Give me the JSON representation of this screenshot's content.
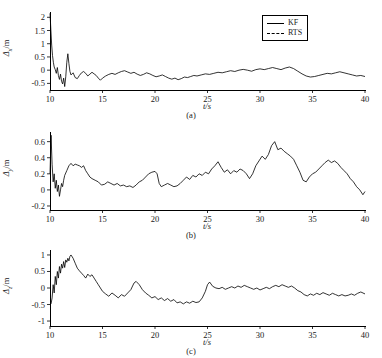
{
  "figure": {
    "legend": {
      "entries": [
        {
          "label": "KF",
          "style": "solid",
          "color": "#000000"
        },
        {
          "label": "RTS",
          "style": "dashed",
          "color": "#000000"
        }
      ]
    }
  },
  "chart_data": [
    {
      "type": "line",
      "panel": "a",
      "caption": "(a)",
      "title": "",
      "xlabel": "t/s",
      "ylabel": "Δx/m",
      "ylabel_symbol": "Δ",
      "ylabel_sub": "x",
      "ylabel_unit": "/m",
      "xlim": [
        10,
        40
      ],
      "ylim": [
        -0.75,
        2.2
      ],
      "xticks": [
        10,
        15,
        20,
        25,
        30,
        35,
        40
      ],
      "yticks": [
        -0.5,
        0,
        0.5,
        1,
        1.5,
        2
      ],
      "ytick_labels": [
        "-0.5",
        "0",
        "0.5",
        "1",
        "1.5",
        "2"
      ],
      "grid": false,
      "legend_position": "top-right",
      "series": [
        {
          "name": "KF",
          "x": [
            10.0,
            10.08,
            10.16,
            10.24,
            10.32,
            10.4,
            10.5,
            10.6,
            10.7,
            10.8,
            10.9,
            11.0,
            11.1,
            11.2,
            11.3,
            11.4,
            11.5,
            11.6,
            11.7,
            11.8,
            11.9,
            12.0,
            12.2,
            12.4,
            12.6,
            12.8,
            13.0,
            13.2,
            13.4,
            13.6,
            13.8,
            14.0,
            14.2,
            14.4,
            14.6,
            14.8,
            15.0,
            15.3,
            15.6,
            15.9,
            16.2,
            16.5,
            16.8,
            17.1,
            17.4,
            17.7,
            18.0,
            18.3,
            18.6,
            18.9,
            19.2,
            19.5,
            19.8,
            20.1,
            20.4,
            20.7,
            21.0,
            21.3,
            21.6,
            21.9,
            22.2,
            22.5,
            22.8,
            23.1,
            23.4,
            23.7,
            24.0,
            24.4,
            24.8,
            25.2,
            25.6,
            26.0,
            26.4,
            26.8,
            27.2,
            27.6,
            28.0,
            28.4,
            28.8,
            29.2,
            29.6,
            30.0,
            30.4,
            30.8,
            31.2,
            31.6,
            32.0,
            32.4,
            32.8,
            33.2,
            33.6,
            34.0,
            34.4,
            34.8,
            35.2,
            35.6,
            36.0,
            36.4,
            36.8,
            37.2,
            37.6,
            38.0,
            38.4,
            38.8,
            39.2,
            39.6,
            40.0
          ],
          "values": [
            2.15,
            1.55,
            0.95,
            0.55,
            0.3,
            0.12,
            0.02,
            -0.12,
            0.1,
            -0.2,
            -0.35,
            -0.15,
            -0.42,
            -0.52,
            -0.3,
            -0.62,
            -0.25,
            0.3,
            0.62,
            0.25,
            -0.05,
            -0.18,
            -0.1,
            -0.28,
            -0.32,
            -0.2,
            -0.1,
            -0.05,
            -0.12,
            -0.22,
            -0.15,
            -0.08,
            -0.14,
            -0.2,
            -0.3,
            -0.38,
            -0.3,
            -0.22,
            -0.16,
            -0.12,
            -0.16,
            -0.1,
            -0.05,
            -0.02,
            -0.07,
            -0.12,
            -0.08,
            -0.15,
            -0.2,
            -0.16,
            -0.1,
            -0.14,
            -0.2,
            -0.25,
            -0.22,
            -0.18,
            -0.24,
            -0.3,
            -0.34,
            -0.3,
            -0.36,
            -0.32,
            -0.26,
            -0.28,
            -0.24,
            -0.2,
            -0.22,
            -0.18,
            -0.14,
            -0.16,
            -0.12,
            -0.08,
            -0.1,
            -0.06,
            -0.02,
            -0.05,
            0.0,
            0.03,
            0.0,
            -0.04,
            0.02,
            0.05,
            0.02,
            0.06,
            0.1,
            0.06,
            0.02,
            0.08,
            0.12,
            0.06,
            -0.04,
            -0.14,
            -0.22,
            -0.26,
            -0.24,
            -0.2,
            -0.16,
            -0.12,
            -0.14,
            -0.1,
            -0.06,
            -0.1,
            -0.14,
            -0.18,
            -0.22,
            -0.2,
            -0.24
          ]
        }
      ]
    },
    {
      "type": "line",
      "panel": "b",
      "caption": "(b)",
      "title": "",
      "xlabel": "t/s",
      "ylabel": "Δy/m",
      "ylabel_symbol": "Δ",
      "ylabel_sub": "y",
      "ylabel_unit": "/m",
      "xlim": [
        10,
        40
      ],
      "ylim": [
        -0.25,
        0.72
      ],
      "xticks": [
        10,
        15,
        20,
        25,
        30,
        35,
        40
      ],
      "yticks": [
        -0.2,
        0,
        0.2,
        0.4,
        0.6
      ],
      "ytick_labels": [
        "-0.2",
        "0",
        "0.2",
        "0.4",
        "0.6"
      ],
      "grid": false,
      "legend_position": "none",
      "series": [
        {
          "name": "KF",
          "x": [
            10.0,
            10.1,
            10.2,
            10.3,
            10.4,
            10.5,
            10.6,
            10.7,
            10.8,
            10.9,
            11.0,
            11.1,
            11.2,
            11.3,
            11.4,
            11.6,
            11.8,
            12.0,
            12.2,
            12.4,
            12.6,
            12.8,
            13.0,
            13.2,
            13.4,
            13.6,
            13.8,
            14.0,
            14.3,
            14.6,
            14.9,
            15.2,
            15.5,
            15.8,
            16.1,
            16.4,
            16.7,
            17.0,
            17.3,
            17.6,
            17.9,
            18.2,
            18.5,
            18.8,
            19.1,
            19.4,
            19.7,
            20.0,
            20.2,
            20.4,
            20.6,
            20.9,
            21.2,
            21.5,
            21.8,
            22.1,
            22.4,
            22.7,
            23.0,
            23.3,
            23.6,
            23.9,
            24.2,
            24.5,
            24.8,
            25.1,
            25.4,
            25.7,
            26.0,
            26.3,
            26.6,
            26.9,
            27.2,
            27.5,
            27.8,
            28.1,
            28.4,
            28.7,
            29.0,
            29.3,
            29.6,
            29.9,
            30.2,
            30.5,
            30.8,
            31.1,
            31.4,
            31.7,
            32.0,
            32.3,
            32.6,
            32.9,
            33.2,
            33.5,
            33.8,
            34.1,
            34.4,
            34.7,
            35.0,
            35.3,
            35.6,
            35.9,
            36.2,
            36.5,
            36.8,
            37.1,
            37.4,
            37.7,
            38.0,
            38.3,
            38.6,
            38.9,
            39.2,
            39.5,
            39.8,
            40.0
          ],
          "values": [
            0.2,
            0.68,
            0.32,
            0.1,
            0.2,
            0.02,
            0.12,
            -0.02,
            0.06,
            -0.08,
            0.0,
            0.08,
            0.04,
            0.12,
            0.18,
            0.24,
            0.3,
            0.33,
            0.3,
            0.32,
            0.31,
            0.3,
            0.28,
            0.3,
            0.24,
            0.2,
            0.16,
            0.14,
            0.12,
            0.1,
            0.06,
            0.07,
            0.1,
            0.08,
            0.06,
            0.08,
            0.05,
            0.06,
            0.04,
            0.05,
            0.03,
            0.06,
            0.1,
            0.12,
            0.16,
            0.2,
            0.22,
            0.23,
            0.2,
            0.08,
            0.04,
            0.06,
            0.08,
            0.06,
            0.04,
            0.05,
            0.08,
            0.12,
            0.16,
            0.13,
            0.18,
            0.16,
            0.2,
            0.18,
            0.22,
            0.2,
            0.26,
            0.3,
            0.35,
            0.28,
            0.22,
            0.25,
            0.2,
            0.24,
            0.22,
            0.26,
            0.24,
            0.2,
            0.14,
            0.2,
            0.3,
            0.36,
            0.42,
            0.38,
            0.44,
            0.55,
            0.6,
            0.5,
            0.52,
            0.48,
            0.45,
            0.42,
            0.38,
            0.3,
            0.22,
            0.12,
            0.1,
            0.16,
            0.2,
            0.22,
            0.26,
            0.3,
            0.34,
            0.37,
            0.34,
            0.36,
            0.33,
            0.28,
            0.24,
            0.2,
            0.14,
            0.1,
            0.04,
            0.0,
            -0.06,
            -0.02
          ]
        }
      ]
    },
    {
      "type": "line",
      "panel": "c",
      "caption": "(c)",
      "title": "",
      "xlabel": "t/s",
      "ylabel": "Δz/m",
      "ylabel_symbol": "Δ",
      "ylabel_sub": "z",
      "ylabel_unit": "/m",
      "xlim": [
        10,
        40
      ],
      "ylim": [
        -1.15,
        1.15
      ],
      "xticks": [
        10,
        15,
        20,
        25,
        30,
        35,
        40
      ],
      "yticks": [
        -1,
        -0.5,
        0,
        0.5,
        1
      ],
      "ytick_labels": [
        "-1",
        "-0.5",
        "0",
        "0.5",
        "1"
      ],
      "grid": false,
      "legend_position": "none",
      "series": [
        {
          "name": "KF",
          "x": [
            10.0,
            10.1,
            10.2,
            10.3,
            10.4,
            10.5,
            10.6,
            10.7,
            10.8,
            10.9,
            11.0,
            11.1,
            11.2,
            11.3,
            11.4,
            11.5,
            11.6,
            11.7,
            11.8,
            11.9,
            12.0,
            12.2,
            12.4,
            12.6,
            12.8,
            13.0,
            13.2,
            13.4,
            13.6,
            13.8,
            14.0,
            14.2,
            14.4,
            14.6,
            14.8,
            15.0,
            15.3,
            15.6,
            15.9,
            16.2,
            16.5,
            16.8,
            17.1,
            17.4,
            17.7,
            18.0,
            18.2,
            18.5,
            18.8,
            19.1,
            19.4,
            19.7,
            20.0,
            20.3,
            20.6,
            20.9,
            21.2,
            21.5,
            21.8,
            22.1,
            22.4,
            22.7,
            23.0,
            23.3,
            23.6,
            23.9,
            24.2,
            24.5,
            24.8,
            25.0,
            25.2,
            25.5,
            25.8,
            26.1,
            26.4,
            26.7,
            27.0,
            27.3,
            27.6,
            27.9,
            28.2,
            28.5,
            28.8,
            29.1,
            29.4,
            29.7,
            30.0,
            30.3,
            30.6,
            30.9,
            31.2,
            31.5,
            31.8,
            32.1,
            32.4,
            32.7,
            33.0,
            33.3,
            33.6,
            33.9,
            34.2,
            34.5,
            34.8,
            35.1,
            35.4,
            35.7,
            36.0,
            36.3,
            36.6,
            36.9,
            37.2,
            37.5,
            37.8,
            38.1,
            38.4,
            38.7,
            39.0,
            39.3,
            39.6,
            40.0
          ],
          "values": [
            -0.5,
            -0.48,
            -0.3,
            0.1,
            -0.15,
            0.35,
            0.1,
            0.5,
            0.3,
            0.65,
            0.45,
            0.72,
            0.6,
            0.8,
            0.62,
            0.85,
            0.78,
            0.9,
            0.82,
            0.96,
            1.0,
            0.9,
            0.75,
            0.6,
            0.52,
            0.45,
            0.38,
            0.3,
            0.42,
            0.35,
            0.4,
            0.3,
            0.2,
            0.1,
            0.0,
            -0.1,
            -0.18,
            -0.25,
            -0.15,
            -0.22,
            -0.3,
            -0.2,
            -0.25,
            -0.15,
            -0.05,
            0.15,
            0.2,
            0.1,
            -0.05,
            -0.15,
            -0.22,
            -0.3,
            -0.26,
            -0.35,
            -0.3,
            -0.38,
            -0.32,
            -0.4,
            -0.35,
            -0.45,
            -0.42,
            -0.48,
            -0.42,
            -0.46,
            -0.4,
            -0.44,
            -0.42,
            -0.3,
            -0.1,
            0.1,
            0.18,
            0.05,
            0.0,
            -0.02,
            0.02,
            -0.04,
            0.0,
            0.04,
            0.0,
            0.06,
            0.02,
            0.08,
            0.04,
            0.0,
            -0.04,
            0.0,
            -0.06,
            -0.02,
            0.02,
            -0.02,
            0.04,
            0.08,
            0.04,
            0.1,
            0.06,
            0.02,
            0.06,
            0.0,
            -0.08,
            -0.12,
            -0.2,
            -0.24,
            -0.18,
            -0.22,
            -0.16,
            -0.2,
            -0.14,
            -0.18,
            -0.22,
            -0.16,
            -0.2,
            -0.24,
            -0.2,
            -0.24,
            -0.22,
            -0.18,
            -0.22,
            -0.16,
            -0.12,
            -0.18,
            -0.22
          ]
        }
      ]
    }
  ]
}
